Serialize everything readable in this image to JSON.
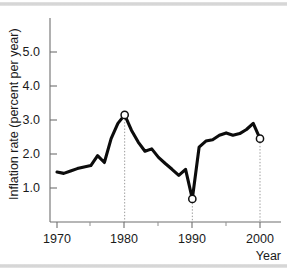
{
  "figure": {
    "background_color": "#ffffff",
    "line_color": "#0c0c0c",
    "marker_fill": "#ffffff",
    "marker_stroke": "#111111",
    "dropline_color": "#9a9a9a",
    "axis_color": "#6f6f6f",
    "band_color": "#cfcfcf"
  },
  "chart_data": {
    "type": "line",
    "title": "",
    "subtitle": "",
    "xlabel": "Year",
    "ylabel": "Inflation rate (percent per year)",
    "xlim": [
      1969,
      2001.5
    ],
    "ylim": [
      0.0,
      5.85
    ],
    "grid": false,
    "legend": null,
    "xticks": [
      1970,
      1980,
      1990,
      2000
    ],
    "xtick_labels": [
      "1970",
      "1980",
      "1990",
      "2000"
    ],
    "xminor_ticks": [
      1975,
      1985,
      1995
    ],
    "yticks": [
      1.0,
      2.0,
      3.0,
      4.0,
      5.0
    ],
    "ytick_labels": [
      "1.0",
      "2.0",
      "3.0",
      "4.0",
      "5.0"
    ],
    "series": [
      {
        "name": "Inflation rate",
        "x": [
          1970,
          1971,
          1972,
          1973,
          1974,
          1975,
          1976,
          1977,
          1978,
          1979,
          1980,
          1981,
          1982,
          1983,
          1984,
          1985,
          1986,
          1987,
          1988,
          1989,
          1990,
          1991,
          1992,
          1993,
          1994,
          1995,
          1996,
          1997,
          1998,
          1999,
          2000
        ],
        "values": [
          1.47,
          1.43,
          1.5,
          1.57,
          1.62,
          1.66,
          1.95,
          1.75,
          2.45,
          2.9,
          3.15,
          2.7,
          2.35,
          2.08,
          2.15,
          1.9,
          1.72,
          1.55,
          1.37,
          1.55,
          0.68,
          2.2,
          2.38,
          2.42,
          2.55,
          2.62,
          2.55,
          2.6,
          2.72,
          2.9,
          2.45
        ]
      }
    ],
    "highlighted_points": [
      {
        "label": "1980",
        "x": 1980,
        "y": 3.15,
        "dropline": true
      },
      {
        "label": "1990",
        "x": 1990,
        "y": 0.68,
        "dropline": true
      },
      {
        "label": "2000",
        "x": 2000,
        "y": 2.45,
        "dropline": true
      }
    ]
  }
}
